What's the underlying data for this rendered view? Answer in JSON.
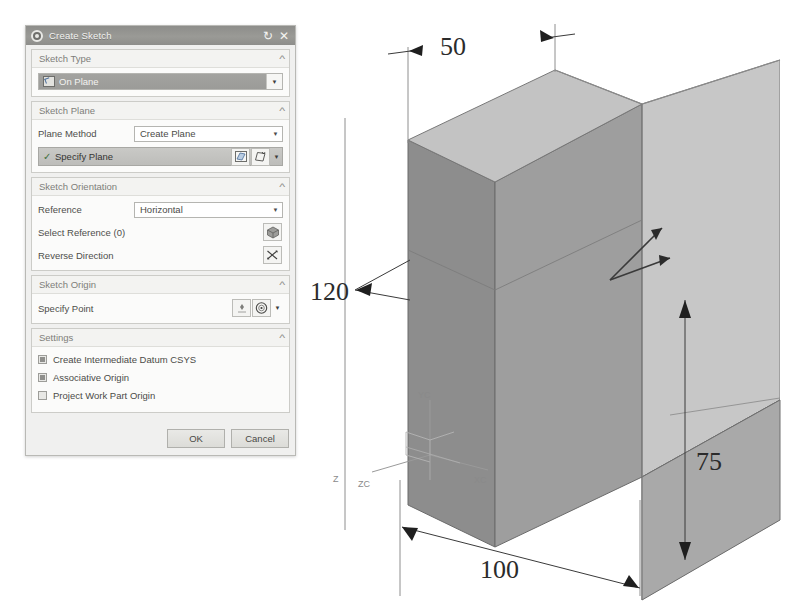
{
  "dialog": {
    "title": "Create Sketch",
    "title_icon": "target-gear-icon",
    "reset_icon": "reset-icon",
    "close_icon": "close-icon",
    "groups": [
      {
        "heading": "Sketch Type",
        "selector_value": "On Plane",
        "selector_icon": "sketch-plane-icon"
      },
      {
        "heading": "Sketch Plane",
        "plane_method_label": "Plane Method",
        "plane_method_value": "Create Plane",
        "specify_plane_label": "Specify Plane",
        "specify_plane_check": "✓",
        "specify_plane_icon_1": "plane-dialog-icon",
        "specify_plane_icon_2": "select-plane-icon",
        "specify_plane_dropdown": "▼"
      },
      {
        "heading": "Sketch Orientation",
        "reference_label": "Reference",
        "reference_value": "Horizontal",
        "select_reference_label": "Select Reference (0)",
        "select_reference_icon": "cube-select-icon",
        "reverse_direction_label": "Reverse Direction",
        "reverse_direction_icon": "reverse-arrows-icon"
      },
      {
        "heading": "Sketch Origin",
        "specify_point_label": "Specify Point",
        "specify_point_icon_1": "point-snap-icon",
        "specify_point_icon_2": "point-target-icon",
        "specify_point_dropdown": "▼"
      },
      {
        "heading": "Settings",
        "checkboxes": [
          {
            "label": "Create Intermediate Datum CSYS",
            "checked": true
          },
          {
            "label": "Associative Origin",
            "checked": true
          },
          {
            "label": "Project Work Part Origin",
            "checked": false
          }
        ]
      }
    ],
    "ok_label": "OK",
    "cancel_label": "Cancel"
  },
  "view": {
    "dimensions": [
      {
        "name": "top-width",
        "value": "50"
      },
      {
        "name": "left-height",
        "value": "120"
      },
      {
        "name": "right-height",
        "value": "75"
      },
      {
        "name": "bottom-width",
        "value": "100"
      }
    ],
    "csys_labels": [
      {
        "name": "y-axis-label",
        "value": "YC"
      },
      {
        "name": "z-axis-label",
        "value": "ZC"
      },
      {
        "name": "x-axis-label",
        "value": "XC"
      },
      {
        "name": "z-axis-label-outer",
        "value": "Z"
      }
    ],
    "face_colors": {
      "front": "#9b9b9b",
      "left": "#8a8a8a",
      "inclined": "#c4c4c4",
      "top": "#bdbdbd",
      "side": "#a8a8a8"
    },
    "selection_arrows": 2
  }
}
